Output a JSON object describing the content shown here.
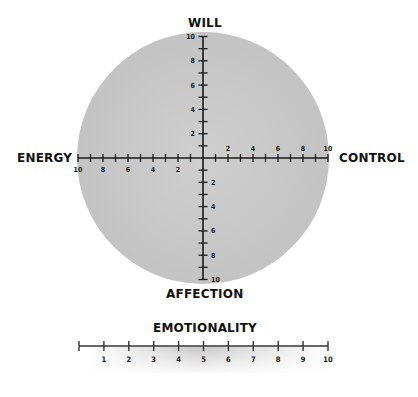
{
  "chart_data": {
    "type": "diagram",
    "title": "",
    "compass": {
      "top_label": "WILL",
      "bottom_label": "AFFECTION",
      "left_label": "ENERGY",
      "right_label": "CONTROL",
      "range": [
        0,
        10
      ],
      "label_step": 2,
      "tick_step": 1,
      "circle_fill": "#c6c6c6",
      "circle_fill_light": "#d4d4d4",
      "x_axis_left_labels": [
        "10",
        "8",
        "6",
        "4",
        "2"
      ],
      "x_axis_right_labels": [
        "2",
        "4",
        "6",
        "8",
        "10"
      ],
      "y_axis_up_labels": [
        "2",
        "4",
        "6",
        "8",
        "10"
      ],
      "y_axis_down_labels": [
        "2",
        "4",
        "6",
        "8",
        "10"
      ]
    },
    "scale": {
      "label": "EMOTIONALITY",
      "range": [
        0,
        10
      ],
      "tick_labels": [
        "1",
        "2",
        "3",
        "4",
        "5",
        "6",
        "7",
        "8",
        "9",
        "10"
      ],
      "gradient_peak_at": 5,
      "gradient_color": "#c8c8c8"
    }
  },
  "labels": {
    "will": "WILL",
    "affection": "AFFECTION",
    "energy": "ENERGY",
    "control": "CONTROL",
    "emotionality": "EMOTIONALITY"
  }
}
